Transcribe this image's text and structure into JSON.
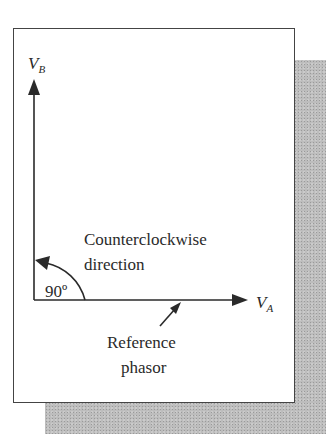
{
  "figure": {
    "vertical_phasor": {
      "label": "V",
      "subscript": "B"
    },
    "horizontal_phasor": {
      "label": "V",
      "subscript": "A"
    },
    "angle_label": "90º",
    "rotation_label_line1": "Counterclockwise",
    "rotation_label_line2": "direction",
    "reference_label_line1": "Reference",
    "reference_label_line2": "phasor"
  },
  "colors": {
    "line": "#2a2a2a",
    "shadow": "#bdbdbd",
    "panel": "#ffffff"
  }
}
